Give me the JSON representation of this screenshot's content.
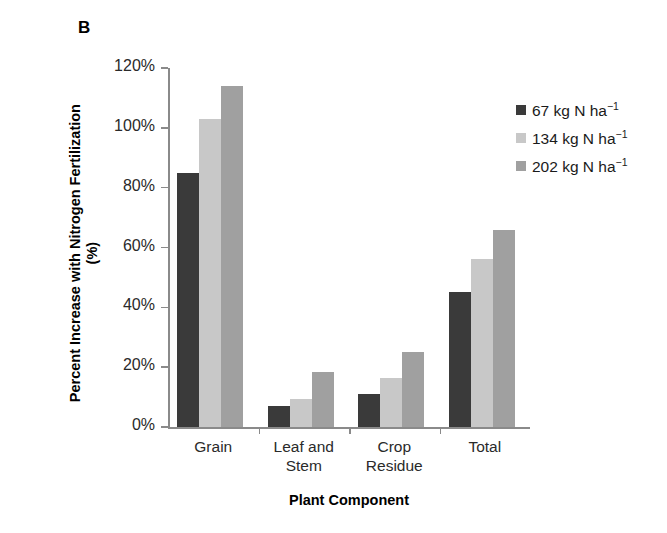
{
  "panel": {
    "label": "B"
  },
  "chart_data": {
    "type": "bar",
    "title": "",
    "xlabel": "Plant Component",
    "ylabel": "Percent Increase with Nitrogen Fertilization (%)",
    "categories": [
      "Grain",
      "Leaf and Stem",
      "Crop Residue",
      "Total"
    ],
    "category_lines": [
      [
        "Grain"
      ],
      [
        "Leaf and",
        "Stem"
      ],
      [
        "Crop",
        "Residue"
      ],
      [
        "Total"
      ]
    ],
    "series": [
      {
        "name": "67 kg N ha−1",
        "rate": 67,
        "unit": "kg N ha",
        "exponent": "−1",
        "color": "#3a3a3a",
        "values": [
          85,
          7,
          11,
          45
        ]
      },
      {
        "name": "134 kg N ha−1",
        "rate": 134,
        "unit": "kg N ha",
        "exponent": "−1",
        "color": "#c8c8c8",
        "values": [
          103,
          9.5,
          16.5,
          56
        ]
      },
      {
        "name": "202 kg N ha−1",
        "rate": 202,
        "unit": "kg N ha",
        "exponent": "−1",
        "color": "#a0a0a0",
        "values": [
          114,
          18.5,
          25,
          66
        ]
      }
    ],
    "ylim": [
      0,
      120
    ],
    "ytick_values": [
      0,
      20,
      40,
      60,
      80,
      100,
      120
    ],
    "ytick_labels": [
      "0%",
      "20%",
      "40%",
      "60%",
      "80%",
      "100%",
      "120%"
    ],
    "grid": false,
    "legend_position": "right-top",
    "axis_color": "#8a8a8a"
  },
  "legend": {
    "entries": [
      {
        "label_number": "67",
        "label_unit": " kg N ha",
        "label_exp": "−1",
        "color": "#3a3a3a"
      },
      {
        "label_number": "134",
        "label_unit": " kg N ha",
        "label_exp": "−1",
        "color": "#c8c8c8"
      },
      {
        "label_number": "202",
        "label_unit": " kg N ha",
        "label_exp": "−1",
        "color": "#a0a0a0"
      }
    ]
  }
}
